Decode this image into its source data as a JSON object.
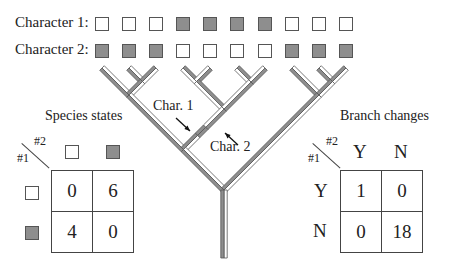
{
  "rows": [
    {
      "label": "Character 1:",
      "states": [
        "w",
        "w",
        "w",
        "g",
        "g",
        "g",
        "g",
        "w",
        "w",
        "w"
      ]
    },
    {
      "label": "Character 2:",
      "states": [
        "g",
        "g",
        "g",
        "w",
        "w",
        "w",
        "w",
        "g",
        "g",
        "g"
      ]
    }
  ],
  "tree": {
    "annotations": {
      "char1": "Char. 1",
      "char2": "Char. 2"
    },
    "colors": {
      "gain": "#8e8e8e",
      "absent": "#ffffff",
      "outline": "#555555"
    }
  },
  "species_states": {
    "title": "Species states",
    "axis_row": "#1",
    "axis_col": "#2",
    "col_headers": [
      "w",
      "g"
    ],
    "row_headers": [
      "w",
      "g"
    ],
    "cells": [
      [
        "0",
        "6"
      ],
      [
        "4",
        "0"
      ]
    ]
  },
  "branch_changes": {
    "title": "Branch changes",
    "axis_row": "#1",
    "axis_col": "#2",
    "col_headers": [
      "Y",
      "N"
    ],
    "row_headers": [
      "Y",
      "N"
    ],
    "cells": [
      [
        "1",
        "0"
      ],
      [
        "0",
        "18"
      ]
    ]
  }
}
